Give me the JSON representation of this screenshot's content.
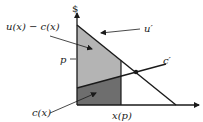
{
  "diagram": {
    "y_axis_label": "$",
    "labels": {
      "surplus": "u(x) − c(x)",
      "marginal_utility": "u′",
      "price": "p",
      "marginal_cost": "c′",
      "cost": "c(x)",
      "quantity": "x(p)"
    },
    "colors": {
      "light_region": "#b4b4b4",
      "dark_region": "#6e6e6e",
      "line": "#1a1a1a"
    }
  }
}
